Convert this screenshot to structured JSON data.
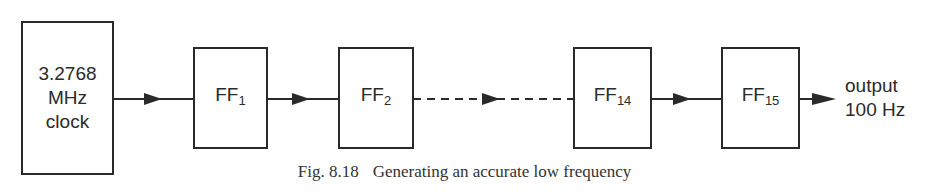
{
  "diagram": {
    "type": "block-diagram",
    "clock": {
      "lines": [
        "3.2768",
        "MHz",
        "clock"
      ]
    },
    "blocks": [
      {
        "id": "ff1",
        "label": "FF",
        "subscript": "1"
      },
      {
        "id": "ff2",
        "label": "FF",
        "subscript": "2"
      },
      {
        "id": "ff14",
        "label": "FF",
        "subscript": "14"
      },
      {
        "id": "ff15",
        "label": "FF",
        "subscript": "15"
      }
    ],
    "output": {
      "lines": [
        "output",
        "100 Hz"
      ]
    },
    "connections": [
      {
        "from": "clock",
        "to": "ff1",
        "style": "solid"
      },
      {
        "from": "ff1",
        "to": "ff2",
        "style": "solid"
      },
      {
        "from": "ff2",
        "to": "ff14",
        "style": "dashed"
      },
      {
        "from": "ff14",
        "to": "ff15",
        "style": "solid"
      },
      {
        "from": "ff15",
        "to": "output",
        "style": "solid"
      }
    ]
  },
  "caption": {
    "number": "Fig. 8.18",
    "text": "Generating an accurate low frequency"
  },
  "colors": {
    "ink": "#2a2a2a",
    "background": "#ffffff"
  }
}
